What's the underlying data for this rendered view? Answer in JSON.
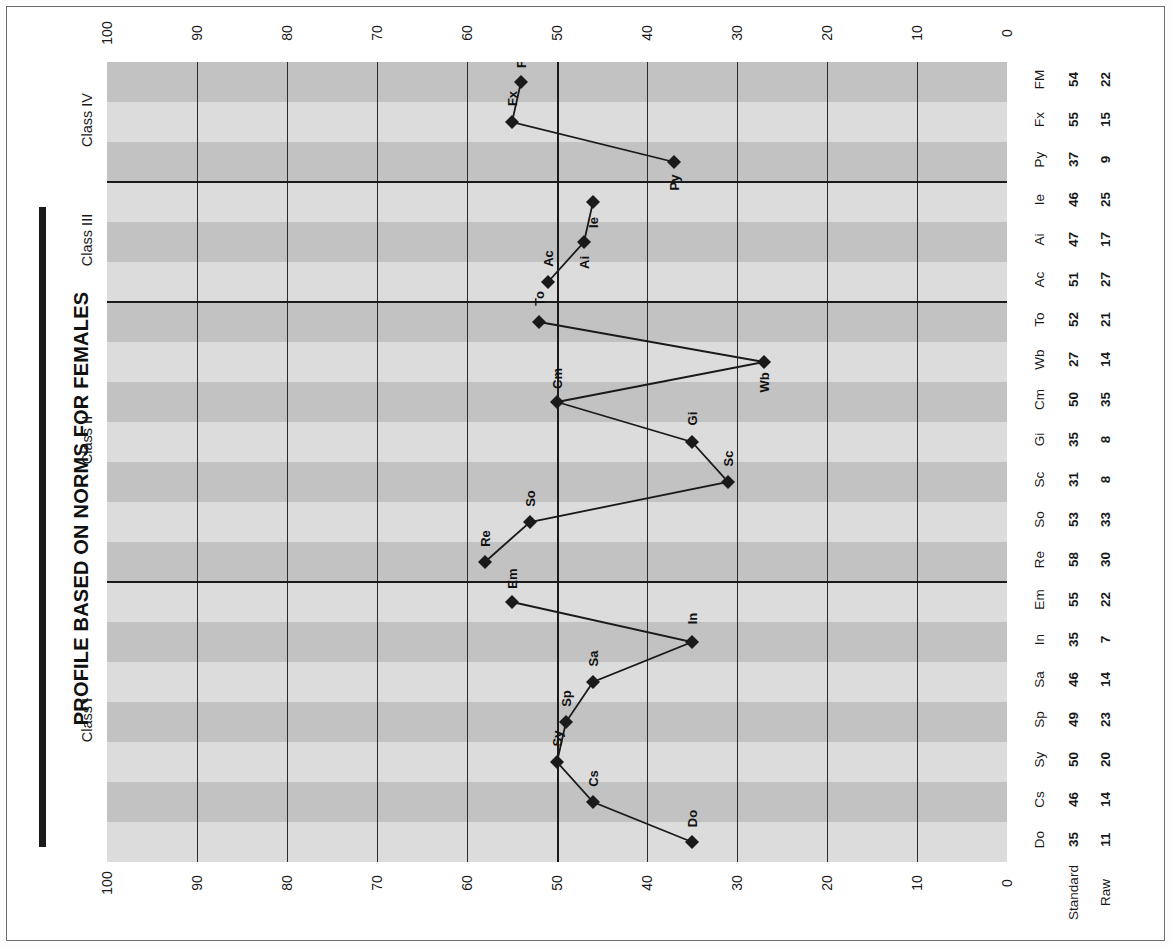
{
  "title": "PROFILE BASED ON NORMS FOR FEMALES",
  "row_labels": {
    "standard": "Standard",
    "raw": "Raw"
  },
  "axis": {
    "ticks": [
      "100",
      "90",
      "80",
      "70",
      "60",
      "50",
      "40",
      "30",
      "20",
      "10",
      "0"
    ],
    "min": 0,
    "max": 100,
    "reversed": true
  },
  "classes": [
    {
      "name": "Class I",
      "first": 0,
      "last": 6
    },
    {
      "name": "Class II",
      "first": 7,
      "last": 13
    },
    {
      "name": "Class III",
      "first": 14,
      "last": 16
    },
    {
      "name": "Class IV",
      "first": 17,
      "last": 19
    }
  ],
  "chart_data": {
    "type": "line",
    "title": "PROFILE BASED ON NORMS FOR FEMALES",
    "xlabel": "",
    "ylabel": "",
    "orientation": "vertical-categories",
    "ylim": [
      0,
      100
    ],
    "grid": true,
    "legend": "none",
    "categories": [
      "Do",
      "Cs",
      "Sy",
      "Sp",
      "Sa",
      "In",
      "Em",
      "Re",
      "So",
      "Sc",
      "Gi",
      "Cm",
      "Wb",
      "To",
      "Ac",
      "Ai",
      "Ie",
      "Py",
      "Fx",
      "FM"
    ],
    "series": [
      {
        "name": "Standard",
        "values": [
          35,
          46,
          50,
          49,
          46,
          35,
          55,
          58,
          53,
          31,
          35,
          50,
          27,
          52,
          51,
          47,
          46,
          37,
          55,
          54
        ]
      },
      {
        "name": "Raw",
        "values": [
          11,
          14,
          20,
          23,
          14,
          7,
          22,
          30,
          33,
          8,
          8,
          35,
          14,
          21,
          27,
          17,
          25,
          9,
          15,
          22
        ]
      }
    ],
    "plotted_series": "Standard",
    "class_groups": [
      {
        "name": "Class I",
        "scales": [
          "Do",
          "Cs",
          "Sy",
          "Sp",
          "Sa",
          "In",
          "Em"
        ]
      },
      {
        "name": "Class II",
        "scales": [
          "Re",
          "So",
          "Sc",
          "Gi",
          "Cm",
          "Wb",
          "To"
        ]
      },
      {
        "name": "Class III",
        "scales": [
          "Ac",
          "Ai",
          "Ie"
        ]
      },
      {
        "name": "Class IV",
        "scales": [
          "Py",
          "Fx",
          "FM"
        ]
      }
    ]
  }
}
